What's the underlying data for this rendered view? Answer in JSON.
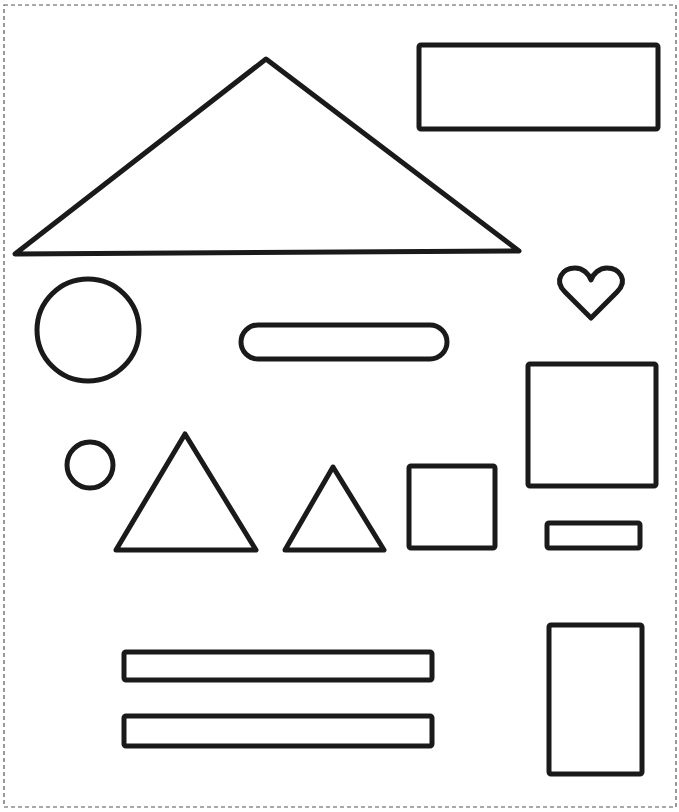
{
  "page": {
    "width": 679,
    "height": 812,
    "background": "#ffffff"
  },
  "border": {
    "style": "dashed",
    "color": "#555555",
    "x": 4,
    "y": 5,
    "width": 672,
    "height": 802
  },
  "stroke": {
    "color": "#1a1a1a",
    "width": 5
  },
  "shapes": [
    {
      "name": "large-triangle",
      "type": "polygon",
      "points": "15,254 266,59 519,251"
    },
    {
      "name": "wide-rectangle-top",
      "type": "rect",
      "x": 419,
      "y": 45,
      "w": 239,
      "h": 84,
      "rx": 2
    },
    {
      "name": "heart",
      "type": "heart",
      "cx": 591,
      "cy": 292
    },
    {
      "name": "large-circle",
      "type": "circle",
      "cx": 88,
      "cy": 330,
      "r": 51
    },
    {
      "name": "rounded-bar",
      "type": "rect",
      "x": 241,
      "y": 325,
      "w": 206,
      "h": 34,
      "rx": 17
    },
    {
      "name": "square-right",
      "type": "rect",
      "x": 528,
      "y": 364,
      "w": 128,
      "h": 122,
      "rx": 2
    },
    {
      "name": "small-circle",
      "type": "circle",
      "cx": 90,
      "cy": 465,
      "r": 23
    },
    {
      "name": "medium-triangle",
      "type": "polygon",
      "points": "116,550 185,434 256,550"
    },
    {
      "name": "small-triangle",
      "type": "polygon",
      "points": "285,550 333,467 384,550"
    },
    {
      "name": "small-square",
      "type": "rect",
      "x": 409,
      "y": 466,
      "w": 86,
      "h": 82,
      "rx": 2
    },
    {
      "name": "small-rectangle",
      "type": "rect",
      "x": 547,
      "y": 523,
      "w": 93,
      "h": 25,
      "rx": 2
    },
    {
      "name": "long-bar-upper",
      "type": "rect",
      "x": 124,
      "y": 652,
      "w": 308,
      "h": 28,
      "rx": 2
    },
    {
      "name": "long-bar-lower",
      "type": "rect",
      "x": 124,
      "y": 716,
      "w": 308,
      "h": 30,
      "rx": 2
    },
    {
      "name": "tall-rectangle",
      "type": "rect",
      "x": 549,
      "y": 625,
      "w": 93,
      "h": 149,
      "rx": 2
    }
  ]
}
